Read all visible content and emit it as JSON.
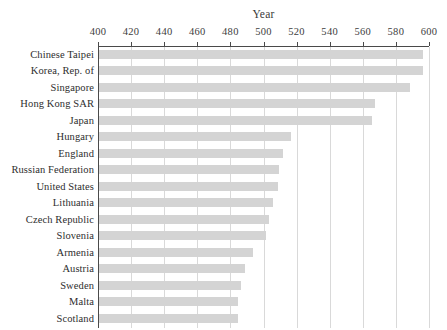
{
  "chart_data": {
    "type": "bar",
    "orientation": "horizontal",
    "title": "",
    "xlabel": "Year",
    "ylabel": "",
    "xlim": [
      400,
      600
    ],
    "xticks": [
      400,
      420,
      440,
      460,
      480,
      500,
      520,
      540,
      560,
      580,
      600
    ],
    "grid": true,
    "legend": null,
    "bar_color": "#d4d4d4",
    "axis_color": "#4a4a4a",
    "gridline_color": "#d9d9d9",
    "categories": [
      "Chinese Taipei",
      "Korea, Rep. of",
      "Singapore",
      "Hong Kong SAR",
      "Japan",
      "Hungary",
      "England",
      "Russian Federation",
      "United States",
      "Lithuania",
      "Czech Republic",
      "Slovenia",
      "Armenia",
      "Austria",
      "Sweden",
      "Malta",
      "Scotland"
    ],
    "values": [
      596,
      596,
      588,
      567,
      565,
      516,
      511,
      509,
      508,
      505,
      503,
      501,
      493,
      488,
      486,
      484,
      484
    ]
  },
  "artifacts": {
    "top_clipped_text": ""
  }
}
